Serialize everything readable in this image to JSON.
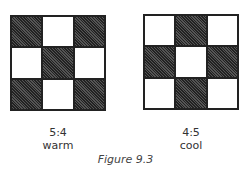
{
  "figures": [
    {
      "ratio": "5:4",
      "name": "warm",
      "pattern": [
        "dark",
        "light",
        "dark",
        "light",
        "dark",
        "light",
        "dark",
        "light",
        "dark"
      ]
    },
    {
      "ratio": "4:5",
      "name": "cool",
      "pattern": [
        "light",
        "dark",
        "light",
        "dark",
        "light",
        "dark",
        "light",
        "dark",
        "light"
      ]
    }
  ],
  "caption": "Figure 9.3",
  "colors": {
    "dark": "#3a3a3a",
    "light": "#ffffff",
    "border": "#222222"
  }
}
